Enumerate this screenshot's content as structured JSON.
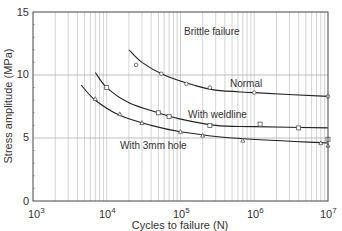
{
  "chart_data": {
    "type": "line",
    "title": "",
    "xlabel": "Cycles to failure (N)",
    "ylabel": "Stress amplitude (MPa)",
    "xscale": "log",
    "xlim": [
      1000,
      10000000
    ],
    "ylim": [
      0,
      15
    ],
    "x_ticks": [
      "10^3",
      "10^4",
      "10^5",
      "10^6",
      "10^7"
    ],
    "y_ticks": [
      "0",
      "5",
      "10",
      "15"
    ],
    "grid": "vertical minor log gridlines + horizontal at 5 and 10",
    "annotations": [
      "Brittle failure"
    ],
    "series": [
      {
        "name": "Normal",
        "marker": "circle",
        "curve": [
          [
            20000,
            12.0
          ],
          [
            30000,
            11.0
          ],
          [
            60000,
            10.0
          ],
          [
            150000,
            9.2
          ],
          [
            300000,
            8.8
          ],
          [
            1000000,
            8.6
          ],
          [
            10000000,
            8.3
          ]
        ],
        "points": [
          [
            25000,
            10.8
          ],
          [
            55000,
            10.1
          ],
          [
            120000,
            9.3
          ],
          [
            250000,
            9.0
          ],
          [
            1000000,
            8.6
          ],
          [
            10000000,
            8.3
          ]
        ]
      },
      {
        "name": "With weldline",
        "marker": "square",
        "curve": [
          [
            7000,
            10.2
          ],
          [
            10000,
            9.0
          ],
          [
            20000,
            7.8
          ],
          [
            50000,
            7.0
          ],
          [
            100000,
            6.5
          ],
          [
            300000,
            6.0
          ],
          [
            1000000,
            5.9
          ],
          [
            10000000,
            5.8
          ]
        ],
        "points": [
          [
            10000,
            9.0
          ],
          [
            50000,
            7.0
          ],
          [
            70000,
            6.7
          ],
          [
            250000,
            6.0
          ],
          [
            1200000,
            6.1
          ],
          [
            4000000,
            5.8
          ],
          [
            10000000,
            4.9
          ]
        ]
      },
      {
        "name": "With 3mm hole",
        "marker": "triangle",
        "curve": [
          [
            4500,
            9.2
          ],
          [
            7000,
            8.0
          ],
          [
            15000,
            6.8
          ],
          [
            40000,
            6.0
          ],
          [
            100000,
            5.5
          ],
          [
            500000,
            5.0
          ],
          [
            10000000,
            4.6
          ]
        ],
        "points": [
          [
            7000,
            8.1
          ],
          [
            15000,
            6.9
          ],
          [
            30000,
            6.2
          ],
          [
            100000,
            5.5
          ],
          [
            200000,
            5.2
          ],
          [
            700000,
            4.8
          ],
          [
            8000000,
            4.6
          ],
          [
            10000000,
            4.4
          ]
        ]
      }
    ]
  },
  "labels": {
    "brittle": "Brittle failure",
    "normal": "Normal",
    "weldline": "With weldline",
    "hole": "With 3mm hole",
    "xaxis": "Cycles to failure (N)",
    "yaxis": "Stress amplitude (MPa)",
    "y0": "0",
    "y5": "5",
    "y10": "10",
    "y15": "15",
    "x_base": "10",
    "x3": "3",
    "x4": "4",
    "x5": "5",
    "x6": "6",
    "x7": "7"
  }
}
